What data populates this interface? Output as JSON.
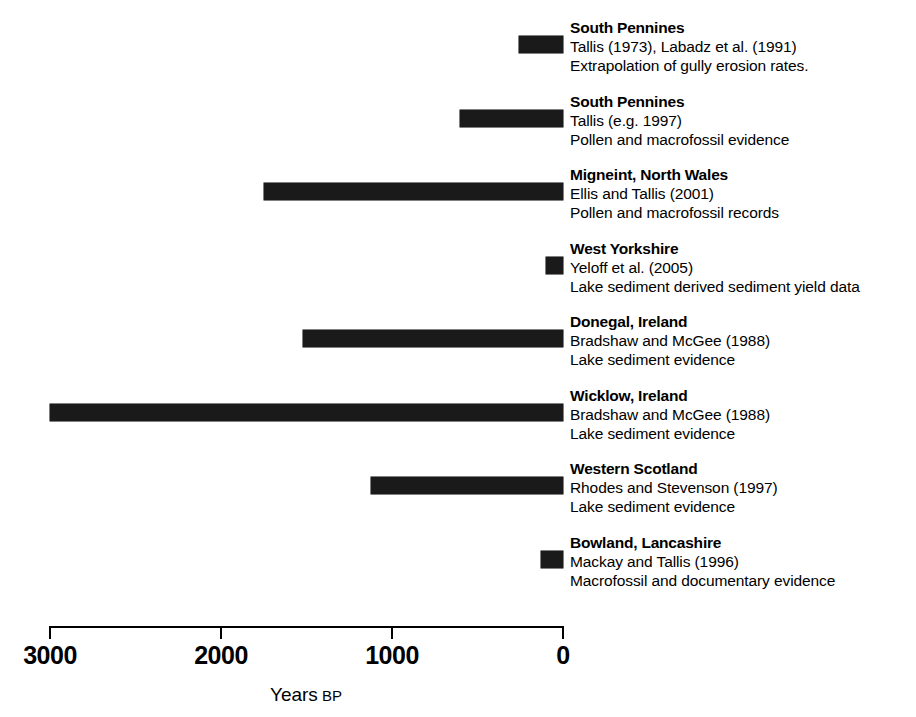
{
  "chart_data": {
    "type": "bar",
    "orientation": "horizontal",
    "title": "",
    "xlabel": "Years BP",
    "xlabel_main": "Years",
    "xlabel_suffix": "BP",
    "ylabel": "",
    "xlim": [
      3000,
      0
    ],
    "x_reversed": true,
    "grid": false,
    "legend": "none",
    "axis_ticks": [
      3000,
      2000,
      1000,
      0
    ],
    "axis_tick_labels": [
      "3000",
      "2000",
      "1000",
      "0"
    ],
    "bar_color": "#1a1a1a",
    "categories": [
      "South Pennines",
      "South Pennines",
      "Migneint, North Wales",
      "West Yorkshire",
      "Donegal, Ireland",
      "Wicklow, Ireland",
      "Western Scotland",
      "Bowland, Lancashire"
    ],
    "series": [
      {
        "name": "Onset of erosion (years BP range)",
        "ranges": [
          [
            260,
            0
          ],
          [
            600,
            0
          ],
          [
            1750,
            0
          ],
          [
            100,
            0
          ],
          [
            1520,
            0
          ],
          [
            3000,
            0
          ],
          [
            1120,
            0
          ],
          [
            130,
            0
          ]
        ],
        "values": [
          260,
          600,
          1750,
          100,
          1520,
          3000,
          1120,
          130
        ]
      }
    ]
  },
  "rows": [
    {
      "title": "South Pennines",
      "reference": "Tallis (1973), Labadz et al. (1991)",
      "description": "Extrapolation of gully erosion rates.",
      "start_bp": 260,
      "end_bp": 0
    },
    {
      "title": "South Pennines",
      "reference": "Tallis (e.g. 1997)",
      "description": "Pollen and macrofossil evidence",
      "start_bp": 600,
      "end_bp": 0
    },
    {
      "title": "Migneint, North Wales",
      "reference": "Ellis and Tallis (2001)",
      "description": "Pollen and macrofossil records",
      "start_bp": 1750,
      "end_bp": 0
    },
    {
      "title": "West Yorkshire",
      "reference": "Yeloff et al. (2005)",
      "description": "Lake sediment derived sediment yield data",
      "start_bp": 100,
      "end_bp": 0
    },
    {
      "title": "Donegal, Ireland",
      "reference": "Bradshaw and McGee (1988)",
      "description": "Lake sediment evidence",
      "start_bp": 1520,
      "end_bp": 0
    },
    {
      "title": "Wicklow, Ireland",
      "reference": "Bradshaw and McGee (1988)",
      "description": "Lake sediment evidence",
      "start_bp": 3000,
      "end_bp": 0
    },
    {
      "title": "Western Scotland",
      "reference": "Rhodes and Stevenson (1997)",
      "description": "Lake sediment evidence",
      "start_bp": 1120,
      "end_bp": 0
    },
    {
      "title": "Bowland, Lancashire",
      "reference": "Mackay and Tallis (1996)",
      "description": "Macrofossil and documentary evidence",
      "start_bp": 130,
      "end_bp": 0
    }
  ],
  "axis": {
    "ticks": [
      "3000",
      "2000",
      "1000",
      "0"
    ],
    "title_main": "Years",
    "title_suffix": "BP"
  }
}
